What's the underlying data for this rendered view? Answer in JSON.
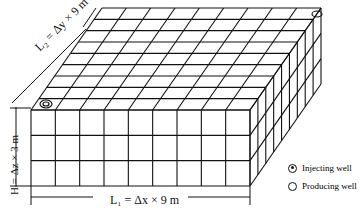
{
  "diagram": {
    "type": "3D reservoir grid block model",
    "grid": {
      "nx": 9,
      "ny": 9,
      "nz": 3
    },
    "labels": {
      "length_x": "L₁ = Δx × 9 m",
      "length_y": "L₂ = Δy × 9 m",
      "height": "H = Δz × 3 m"
    },
    "wells": [
      {
        "type": "injecting",
        "position": "front-left top corner"
      },
      {
        "type": "producing",
        "position": "back-right top corner"
      }
    ]
  },
  "legend": {
    "items": [
      {
        "symbol": "injecting-well-icon",
        "label": "Injecting well"
      },
      {
        "symbol": "producing-well-icon",
        "label": "Producing well"
      }
    ]
  },
  "colors": {
    "line": "#111111",
    "background": "#ffffff"
  }
}
